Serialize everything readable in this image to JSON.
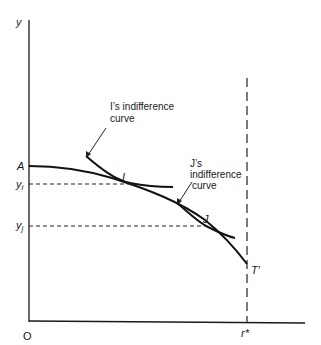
{
  "diagram": {
    "axes": {
      "y_label": "y",
      "origin_label": "O",
      "x_marker_label": "r*"
    },
    "points": {
      "A": "A",
      "I": "I",
      "J": "J",
      "T": "T′"
    },
    "y_ticks": {
      "yi": "y",
      "yi_sub": "i",
      "yj": "y",
      "yj_sub": "j"
    },
    "annotations": {
      "i_curve_line1": "I’s indifference",
      "i_curve_line2": "curve",
      "j_curve_line1": "J’s",
      "j_curve_line2": "indifference",
      "j_curve_line3": "curve"
    }
  }
}
